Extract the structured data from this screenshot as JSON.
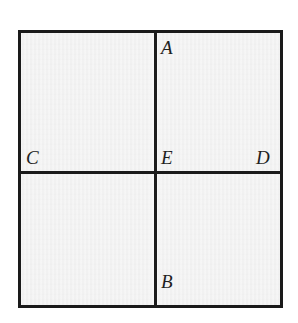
{
  "figure": {
    "kind": "geometry-diagram",
    "shape": "square",
    "fill_color": "#f1f1f1",
    "line_color": "#1a1a1a",
    "background_color": "#ffffff",
    "labels": [
      {
        "id": "a",
        "text": "A",
        "position": "top-of-vertical-divider"
      },
      {
        "id": "b",
        "text": "B",
        "position": "bottom-of-vertical-divider"
      },
      {
        "id": "c",
        "text": "C",
        "position": "left-end-of-horizontal-divider"
      },
      {
        "id": "d",
        "text": "D",
        "position": "right-end-of-horizontal-divider"
      },
      {
        "id": "e",
        "text": "E",
        "position": "center-intersection"
      }
    ]
  },
  "chart_data": {
    "type": "diagram",
    "title": "",
    "xlabel": "",
    "ylabel": "",
    "grid": true,
    "elements": {
      "outer_square": {
        "x": 18,
        "y": 30,
        "width": 265,
        "height": 278,
        "stroke_width": 3
      },
      "vertical_divider": {
        "x": 154,
        "y_start": 30,
        "y_end": 308
      },
      "horizontal_divider": {
        "y": 171,
        "x_start": 18,
        "x_end": 283
      },
      "points": [
        {
          "label": "A",
          "x": 155,
          "y": 30
        },
        {
          "label": "B",
          "x": 155,
          "y": 308
        },
        {
          "label": "C",
          "x": 18,
          "y": 171
        },
        {
          "label": "D",
          "x": 283,
          "y": 171
        },
        {
          "label": "E",
          "x": 155,
          "y": 171
        }
      ]
    }
  }
}
